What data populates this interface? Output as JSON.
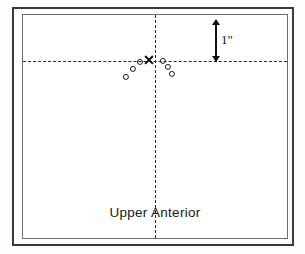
{
  "figure": {
    "caption": "Upper  Anterior",
    "scale": {
      "label": "1\"",
      "icon": "double-headed-vertical-arrow",
      "value": 1,
      "unit": "inch"
    }
  },
  "chart_data": {
    "type": "scatter",
    "title": "Upper  Anterior",
    "xlabel": "",
    "ylabel": "",
    "grid": false,
    "legend": null,
    "axis_style": "dashed-crosshair",
    "origin": {
      "x": 0,
      "y": 0
    },
    "xlim": [
      -2.64,
      2.64
    ],
    "ylim": [
      -3.54,
      0.92
    ],
    "scale_bar_inches": 1,
    "annotations": [
      {
        "name": "scale-bar",
        "text": "1\"",
        "x": 1.66,
        "y": 0.46
      }
    ],
    "series": [
      {
        "name": "reference-point",
        "marker": "x",
        "points": [
          {
            "x": -0.06,
            "y": 0.0
          }
        ]
      },
      {
        "name": "measured-points",
        "marker": "o",
        "points": [
          {
            "x": -0.3,
            "y": -0.04
          },
          {
            "x": -0.44,
            "y": -0.18
          },
          {
            "x": -0.58,
            "y": -0.34
          },
          {
            "x": 0.08,
            "y": -0.02
          },
          {
            "x": 0.18,
            "y": -0.14
          },
          {
            "x": 0.26,
            "y": -0.28
          }
        ]
      }
    ]
  },
  "markers": {
    "cross": {
      "left": 126,
      "top": 45
    },
    "circles": [
      {
        "left": 117,
        "top": 47
      },
      {
        "left": 110,
        "top": 54
      },
      {
        "left": 103,
        "top": 62
      },
      {
        "left": 140,
        "top": 46
      },
      {
        "left": 145,
        "top": 52
      },
      {
        "left": 149,
        "top": 59
      }
    ]
  }
}
